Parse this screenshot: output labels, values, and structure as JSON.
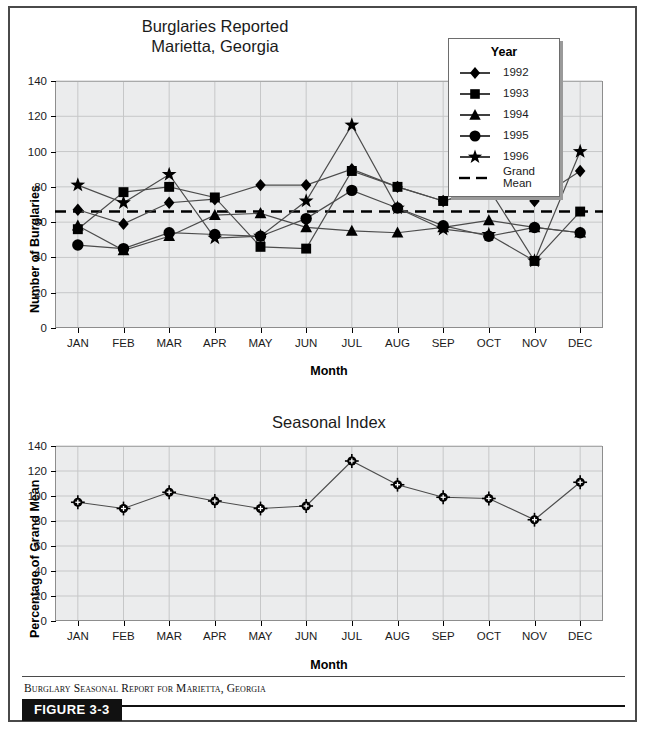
{
  "figure": {
    "caption": "Burglary Seasonal Report for Marietta, Georgia",
    "figure_label": "FIGURE 3-3",
    "border_color": "#4a4a4a",
    "plot_bg_color": "#ebeced",
    "series_color": "#000000"
  },
  "chart_data": [
    {
      "type": "line",
      "title": "Burglaries Reported\nMarietta, Georgia",
      "xlabel": "Month",
      "ylabel": "Number of Burglaries",
      "categories": [
        "JAN",
        "FEB",
        "MAR",
        "APR",
        "MAY",
        "JUN",
        "JUL",
        "AUG",
        "SEP",
        "OCT",
        "NOV",
        "DEC"
      ],
      "ylim": [
        0,
        140
      ],
      "yticks": [
        0,
        20,
        40,
        60,
        80,
        100,
        120,
        140
      ],
      "grid": true,
      "legend_position": "top-right",
      "legend_title": "Year",
      "series": [
        {
          "name": "1992",
          "marker": "diamond",
          "values": [
            67,
            59,
            71,
            73,
            81,
            81,
            90,
            80,
            72,
            79,
            72,
            89
          ]
        },
        {
          "name": "1993",
          "marker": "square",
          "values": [
            56,
            77,
            80,
            74,
            46,
            45,
            89,
            80,
            72,
            79,
            38,
            66
          ]
        },
        {
          "name": "1994",
          "marker": "triangle",
          "values": [
            58,
            44,
            52,
            64,
            65,
            57,
            55,
            54,
            57,
            61,
            57,
            54
          ]
        },
        {
          "name": "1995",
          "marker": "circle",
          "values": [
            47,
            45,
            54,
            53,
            52,
            62,
            78,
            68,
            58,
            52,
            57,
            54
          ]
        },
        {
          "name": "1996",
          "marker": "star",
          "values": [
            81,
            71,
            87,
            51,
            52,
            72,
            115,
            68,
            56,
            53,
            38,
            100
          ]
        }
      ],
      "reference_line": {
        "name": "Grand\nMean",
        "value": 66,
        "style": "dashed"
      }
    },
    {
      "type": "line",
      "title": "Seasonal Index",
      "xlabel": "Month",
      "ylabel": "Percentage of Grand Mean",
      "categories": [
        "JAN",
        "FEB",
        "MAR",
        "APR",
        "MAY",
        "JUN",
        "JUL",
        "AUG",
        "SEP",
        "OCT",
        "NOV",
        "DEC"
      ],
      "ylim": [
        0,
        140
      ],
      "yticks": [
        0,
        20,
        40,
        60,
        80,
        100,
        120,
        140
      ],
      "grid": true,
      "series": [
        {
          "name": "Seasonal Index",
          "marker": "circle-cross",
          "values": [
            95,
            90,
            103,
            96,
            90,
            92,
            128,
            109,
            99,
            98,
            81,
            111
          ]
        }
      ]
    }
  ]
}
